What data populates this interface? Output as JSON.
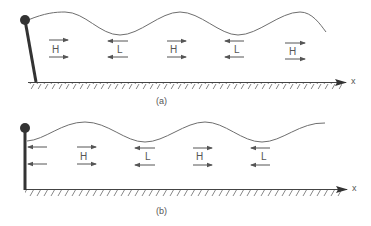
{
  "diagram": {
    "colors": {
      "ink": "#333333",
      "wave": "#6e6e6e",
      "arrow": "#555555",
      "ground": "#777777",
      "background": "#ffffff"
    },
    "panels": [
      {
        "id": "a",
        "caption": "(a)",
        "axis_label": "x",
        "pole": "tilted",
        "regions": [
          {
            "label": "H",
            "direction": "right"
          },
          {
            "label": "L",
            "direction": "left"
          },
          {
            "label": "H",
            "direction": "right"
          },
          {
            "label": "L",
            "direction": "left"
          },
          {
            "label": "H",
            "direction": "right"
          }
        ]
      },
      {
        "id": "b",
        "caption": "(b)",
        "axis_label": "x",
        "pole": "vertical",
        "regions": [
          {
            "label": "",
            "direction": "left"
          },
          {
            "label": "H",
            "direction": "right"
          },
          {
            "label": "L",
            "direction": "left"
          },
          {
            "label": "H",
            "direction": "right"
          },
          {
            "label": "L",
            "direction": "left"
          }
        ]
      }
    ]
  }
}
